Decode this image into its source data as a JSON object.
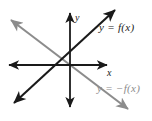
{
  "figure": {
    "type": "coordinate-plane-graph",
    "width": 152,
    "height": 121,
    "background": "#ffffff"
  },
  "axes": {
    "x_label": "x",
    "y_label": "y",
    "color": "#1a1a1a",
    "origin": {
      "x": 70,
      "y": 65
    },
    "x_axis": {
      "x1": 8,
      "y1": 65,
      "x2": 108,
      "y2": 65,
      "arrows": "both"
    },
    "y_axis": {
      "x1": 70,
      "y1": 12,
      "x2": 70,
      "y2": 108,
      "arrows": "both"
    }
  },
  "lines": [
    {
      "id": "f",
      "label": "y = f(x)",
      "color": "#1a1a1a",
      "slope": "positive",
      "arrows": "both",
      "from": {
        "x": 13,
        "y": 104
      },
      "to": {
        "x": 116,
        "y": 9
      }
    },
    {
      "id": "neg-f",
      "label": "y = −f(x)",
      "color": "#8c8c8c",
      "slope": "negative",
      "arrows": "both",
      "from": {
        "x": 10,
        "y": 19
      },
      "to": {
        "x": 129,
        "y": 110
      }
    }
  ],
  "colors": {
    "line_f": "#1a1a1a",
    "line_neg_f": "#8c8c8c",
    "axis": "#1a1a1a",
    "background": "#ffffff"
  }
}
